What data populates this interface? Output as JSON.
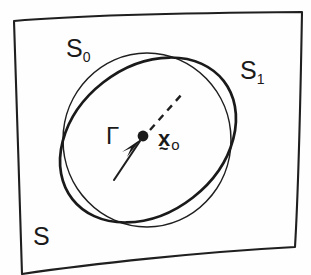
{
  "figure": {
    "type": "hand-drawn-mathematical-diagram",
    "background_color": "#fefefe",
    "ink_color": "#1a1a1a"
  },
  "labels": {
    "outer_region": "S",
    "circle": {
      "base": "S",
      "subscript": "0",
      "full": "S0"
    },
    "ellipse": {
      "base": "S",
      "subscript": "1",
      "full": "S1"
    },
    "curve_gamma": "Γ",
    "point": {
      "base": "x",
      "accent": "~",
      "subscript": "o",
      "full": "x₀"
    }
  },
  "shapes": {
    "outer_boundary": {
      "name": "quadrilateral-region-S",
      "kind": "closed-quadrilateral",
      "stroke_width": 2.1,
      "corners": [
        [
          14,
          20
        ],
        [
          302,
          12
        ],
        [
          295,
          247
        ],
        [
          22,
          274
        ]
      ]
    },
    "circle": {
      "name": "circle-S0",
      "kind": "near-circle",
      "stroke_width": 1.5,
      "center": [
        147,
        140
      ],
      "radius_x": 83,
      "radius_y": 87
    },
    "ellipse": {
      "name": "ellipse-S1",
      "kind": "tilted-ellipse",
      "stroke_width": 2.6,
      "center": [
        148,
        140
      ],
      "radius_x": 96,
      "radius_y": 73,
      "rotation_deg": -38
    },
    "point_marker": {
      "name": "point-x0",
      "kind": "filled-dot",
      "center": [
        143,
        136
      ],
      "radius": 5.4
    },
    "dashed_ray": {
      "name": "dashed-ray",
      "from": [
        149,
        131
      ],
      "to": [
        180,
        96
      ],
      "stroke_width": 2.4,
      "dash_pattern": "7 6"
    },
    "gamma_arrow": {
      "name": "gamma-arrow",
      "from": [
        116,
        178
      ],
      "to": [
        140,
        142
      ],
      "stroke_width": 2.2,
      "arrowhead": "filled-triangle"
    }
  }
}
